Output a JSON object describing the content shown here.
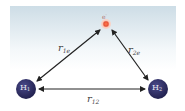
{
  "diagram": {
    "title": "",
    "nodes": {
      "electron": {
        "label": "e",
        "superscript": "-",
        "color": "#e8553a",
        "ring_color": "#f5b7a6"
      },
      "nucleus1": {
        "label": "H",
        "subscript": "1",
        "color": "#2b2a63"
      },
      "nucleus2": {
        "label": "H",
        "subscript": "2",
        "color": "#2b2a63"
      }
    },
    "edges": {
      "r1e": {
        "label": "r",
        "subscript": "1e",
        "from": "nucleus1",
        "to": "electron"
      },
      "r2e": {
        "label": "r",
        "subscript": "2e",
        "from": "nucleus2",
        "to": "electron"
      },
      "r12": {
        "label": "r",
        "subscript": "12",
        "from": "nucleus1",
        "to": "nucleus2"
      }
    },
    "background_color": "#d3e1e9"
  }
}
